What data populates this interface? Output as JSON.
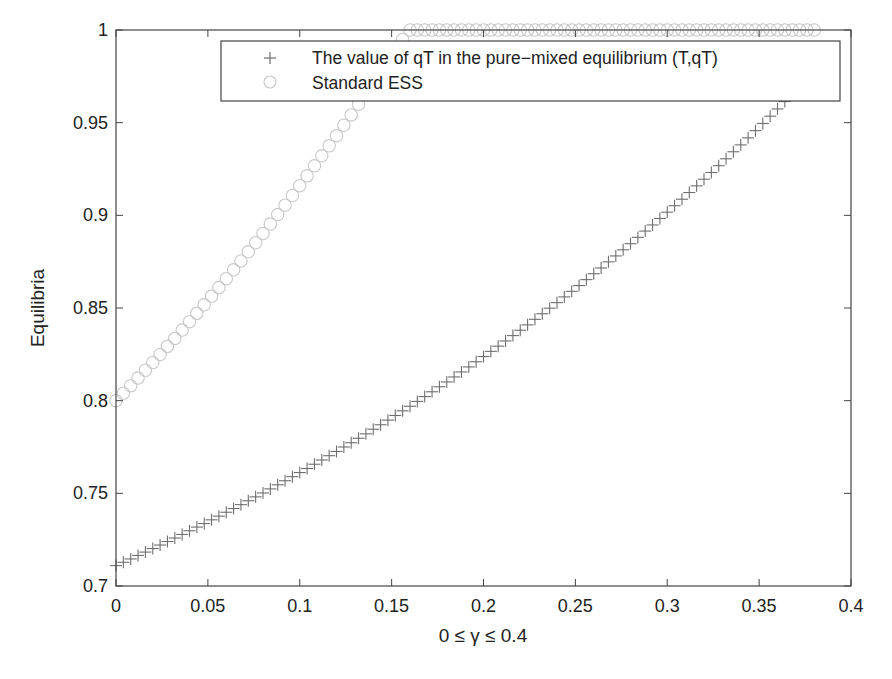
{
  "chart_data": {
    "type": "scatter",
    "title": "",
    "xlabel": "0 ≤ γ ≤ 0.4",
    "ylabel": "Equilibria",
    "xlim": [
      0,
      0.4
    ],
    "ylim": [
      0.7,
      1
    ],
    "grid": false,
    "legend_position": "top-right (inside)",
    "x_ticks": [
      "0",
      "0.05",
      "0.1",
      "0.15",
      "0.2",
      "0.25",
      "0.3",
      "0.35",
      "0.4"
    ],
    "y_ticks": [
      "0.7",
      "0.75",
      "0.8",
      "0.85",
      "0.9",
      "0.95",
      "1"
    ],
    "x_step": 0.004,
    "series": [
      {
        "name": "The value of qT in the pure−mixed equilibrium (T,qT)",
        "marker": "plus",
        "color": "#6e6e6e",
        "x_start": 0,
        "values": [
          0.711,
          0.7128,
          0.7146,
          0.7165,
          0.7183,
          0.7202,
          0.7221,
          0.724,
          0.7259,
          0.7278,
          0.7298,
          0.7318,
          0.7337,
          0.7357,
          0.7377,
          0.7398,
          0.7418,
          0.7439,
          0.746,
          0.7481,
          0.7502,
          0.7524,
          0.7546,
          0.7568,
          0.759,
          0.7612,
          0.7634,
          0.7657,
          0.768,
          0.7703,
          0.7726,
          0.775,
          0.7773,
          0.7797,
          0.7821,
          0.7846,
          0.787,
          0.7895,
          0.792,
          0.7945,
          0.797,
          0.7996,
          0.8022,
          0.8048,
          0.8075,
          0.8101,
          0.8128,
          0.8155,
          0.8182,
          0.821,
          0.8238,
          0.8266,
          0.8294,
          0.8322,
          0.8351,
          0.838,
          0.8409,
          0.8439,
          0.8469,
          0.8499,
          0.8529,
          0.856,
          0.859,
          0.8621,
          0.8653,
          0.8685,
          0.8716,
          0.8749,
          0.8781,
          0.8814,
          0.8847,
          0.8881,
          0.8915,
          0.8948,
          0.8983,
          0.9017,
          0.9052,
          0.9087,
          0.9123,
          0.9159,
          0.9195,
          0.9231,
          0.9268,
          0.9305,
          0.9343,
          0.938,
          0.9418,
          0.9457,
          0.9496,
          0.9535,
          0.9574,
          0.9614,
          0.9654,
          0.9695
        ]
      },
      {
        "name": "Standard ESS",
        "marker": "circle",
        "color": "#c8c8c8",
        "x_start": 0,
        "values": [
          0.8,
          0.804,
          0.8081,
          0.8122,
          0.8164,
          0.8206,
          0.8249,
          0.8293,
          0.8336,
          0.8381,
          0.8426,
          0.8471,
          0.8517,
          0.8563,
          0.861,
          0.8658,
          0.8706,
          0.8754,
          0.8803,
          0.8852,
          0.8902,
          0.8953,
          0.9004,
          0.9055,
          0.9107,
          0.916,
          0.9213,
          0.9267,
          0.9321,
          0.9375,
          0.943,
          0.9486,
          0.9542,
          0.9599,
          0.9656,
          0.9714,
          0.9772,
          0.983,
          0.989,
          0.9949,
          1,
          1,
          1,
          1,
          1,
          1,
          1,
          1,
          1,
          1,
          1,
          1,
          1,
          1,
          1,
          1,
          1,
          1,
          1,
          1,
          1,
          1,
          1,
          1,
          1,
          1,
          1,
          1,
          1,
          1,
          1,
          1,
          1,
          1,
          1,
          1,
          1,
          1,
          1,
          1,
          1,
          1,
          1,
          1,
          1,
          1,
          1,
          1,
          1,
          1,
          1,
          1,
          1,
          1,
          1,
          1
        ]
      }
    ]
  },
  "plot": {
    "left": 116,
    "top": 30,
    "right": 851,
    "bottom": 586,
    "axis_color": "#444444"
  },
  "legend": {
    "entries": [
      {
        "label": "The value of qT in the pure−mixed equilibrium (T,qT)",
        "marker": "plus"
      },
      {
        "label": "Standard ESS",
        "marker": "circle"
      }
    ]
  }
}
